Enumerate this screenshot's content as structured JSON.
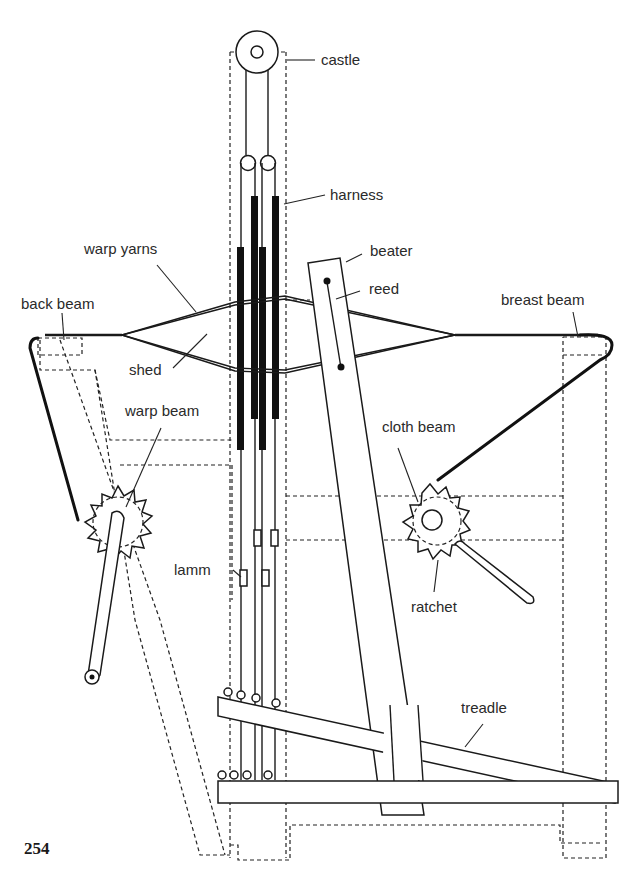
{
  "figure": {
    "page_number": "254"
  },
  "labels": {
    "castle": "castle",
    "harness": "harness",
    "warp_yarns": "warp yarns",
    "beater": "beater",
    "reed": "reed",
    "back_beam": "back beam",
    "breast_beam": "breast beam",
    "shed": "shed",
    "warp_beam": "warp beam",
    "cloth_beam": "cloth beam",
    "lamm": "lamm",
    "ratchet": "ratchet",
    "treadle": "treadle"
  },
  "colors": {
    "ink": "#1a1a1a",
    "background": "#ffffff"
  }
}
